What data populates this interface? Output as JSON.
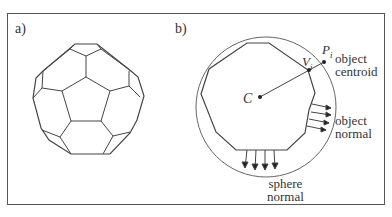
{
  "panels": {
    "a": {
      "label": "a)",
      "description": "truncated icosahedron (soccer ball) wireframe"
    },
    "b": {
      "label": "b)",
      "points": {
        "center": "C",
        "vertex": "V",
        "vertex_sub": "i",
        "sphere_point": "P",
        "sphere_point_sub": "i"
      },
      "annotations": {
        "object_centroid_line1": "object",
        "object_centroid_line2": "centroid",
        "object_normal_line1": "object",
        "object_normal_line2": "normal",
        "sphere_normal_line1": "sphere",
        "sphere_normal_line2": "normal"
      }
    }
  },
  "colors": {
    "line": "#444444",
    "frame": "#555555",
    "text": "#333333",
    "background": "#ffffff"
  }
}
